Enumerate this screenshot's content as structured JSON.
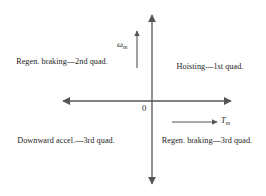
{
  "diagram": {
    "background_color": "#ffffff",
    "line_color": "#555555",
    "text_color": "#1d1d1d",
    "origin_label": "0",
    "axes": {
      "vertical": {
        "name": "speed-axis",
        "variable": "ω",
        "subscript": "m",
        "direction": "up"
      },
      "horizontal": {
        "name": "torque-axis",
        "variable": "T",
        "subscript": "m",
        "direction": "right"
      }
    },
    "quadrants": {
      "first": "Hoisting—1st quad.",
      "second": "Regen. braking—2nd quad.",
      "third_left": "Downward accel.—3rd quad.",
      "third_right": "Regen. braking—3rd quad."
    }
  }
}
